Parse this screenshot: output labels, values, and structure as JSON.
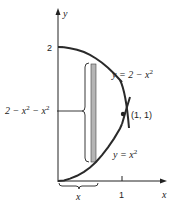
{
  "diagram": {
    "axes": {
      "x_label": "x",
      "y_label": "y",
      "x_tick_label": "1",
      "y_tick_label": "2"
    },
    "curves": {
      "upper": {
        "label_prefix": "y = 2 − x",
        "label_exp": "2"
      },
      "lower": {
        "label_prefix": "y = x",
        "label_exp": "2"
      }
    },
    "intersection_label": "(1, 1)",
    "strip_height_label": "2 − x² − x²",
    "strip_height_parts": {
      "a": "2 − x",
      "exp1": "2",
      "b": " − x",
      "exp2": "2"
    },
    "strip_x_label": "x",
    "colors": {
      "curve": "#2a2a2a",
      "strip_fill": "#b5b5b5",
      "axis": "#222222"
    }
  }
}
